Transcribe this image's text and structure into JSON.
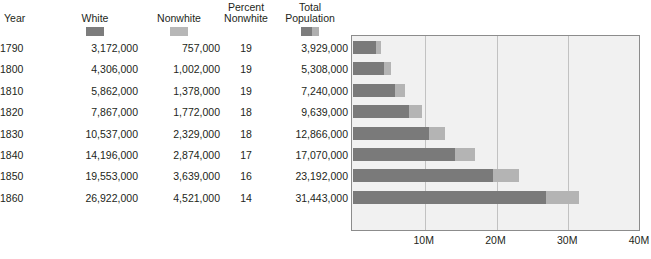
{
  "table": {
    "columns": [
      {
        "key": "year",
        "label": "Year"
      },
      {
        "key": "white",
        "label": "White"
      },
      {
        "key": "nonwhite",
        "label": "Nonwhite"
      },
      {
        "key": "percent_nonwhite",
        "label": "Percent\nNonwhite",
        "line1": "Percent",
        "line2": "Nonwhite"
      },
      {
        "key": "total",
        "label": "Total\nPopulation",
        "line1": "Total",
        "line2": "Population"
      }
    ],
    "swatches": {
      "white": "white-series-swatch",
      "nonwhite": "nonwhite-series-swatch",
      "total": "total-series-swatch"
    },
    "rows": [
      {
        "year": "1790",
        "white": "3,172,000",
        "nonwhite": "757,000",
        "percent_nonwhite": "19",
        "total": "3,929,000"
      },
      {
        "year": "1800",
        "white": "4,306,000",
        "nonwhite": "1,002,000",
        "percent_nonwhite": "19",
        "total": "5,308,000"
      },
      {
        "year": "1810",
        "white": "5,862,000",
        "nonwhite": "1,378,000",
        "percent_nonwhite": "19",
        "total": "7,240,000"
      },
      {
        "year": "1820",
        "white": "7,867,000",
        "nonwhite": "1,772,000",
        "percent_nonwhite": "18",
        "total": "9,639,000"
      },
      {
        "year": "1830",
        "white": "10,537,000",
        "nonwhite": "2,329,000",
        "percent_nonwhite": "18",
        "total": "12,866,000"
      },
      {
        "year": "1840",
        "white": "14,196,000",
        "nonwhite": "2,874,000",
        "percent_nonwhite": "17",
        "total": "17,070,000"
      },
      {
        "year": "1850",
        "white": "19,553,000",
        "nonwhite": "3,639,000",
        "percent_nonwhite": "16",
        "total": "23,192,000"
      },
      {
        "year": "1860",
        "white": "26,922,000",
        "nonwhite": "4,521,000",
        "percent_nonwhite": "14",
        "total": "31,443,000"
      }
    ]
  },
  "colors": {
    "white_series": "#7a7a7a",
    "nonwhite_series": "#b4b4b4",
    "plot_background": "#f1f1f1",
    "plot_border": "#8c8c8c",
    "gridline": "#c2c2c2",
    "text": "#231f20"
  },
  "chart_data": {
    "type": "bar",
    "orientation": "horizontal",
    "stacked": true,
    "title": "",
    "subtitle": "",
    "xlabel": "",
    "ylabel": "",
    "categories": [
      "1790",
      "1800",
      "1810",
      "1820",
      "1830",
      "1840",
      "1850",
      "1860"
    ],
    "series": [
      {
        "name": "White",
        "color": "#7a7a7a",
        "values": [
          3172000,
          4306000,
          5862000,
          7867000,
          10537000,
          14196000,
          19553000,
          26922000
        ]
      },
      {
        "name": "Nonwhite",
        "color": "#b4b4b4",
        "values": [
          757000,
          1002000,
          1378000,
          1772000,
          2329000,
          2874000,
          3639000,
          4521000
        ]
      }
    ],
    "totals": [
      3929000,
      5308000,
      7240000,
      9639000,
      12866000,
      17070000,
      23192000,
      31443000
    ],
    "percent_nonwhite": [
      19,
      19,
      19,
      18,
      18,
      17,
      16,
      14
    ],
    "xlim": [
      0,
      40000000
    ],
    "xticks": [
      10000000,
      20000000,
      30000000,
      40000000
    ],
    "xtick_labels": [
      "10M",
      "20M",
      "30M",
      "40M"
    ],
    "grid": true,
    "grid_axis": "x",
    "legend": "none",
    "legend_position": "table-header-swatches"
  }
}
